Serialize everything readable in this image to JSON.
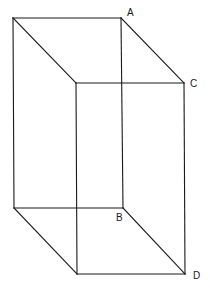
{
  "diagram": {
    "type": "rectangular-prism-wireframe",
    "labels": {
      "A": "A",
      "B": "B",
      "C": "C",
      "D": "D"
    },
    "vertices": {
      "back_top_left": [
        13,
        18
      ],
      "A": [
        121,
        18
      ],
      "back_bottom_left": [
        14,
        208
      ],
      "B": [
        123,
        208
      ],
      "front_top_left": [
        76,
        83
      ],
      "C": [
        184,
        83
      ],
      "front_bottom_left": [
        77,
        274
      ],
      "D": [
        185,
        274
      ]
    },
    "label_positions": {
      "A": [
        127,
        16
      ],
      "B": [
        116,
        221
      ],
      "C": [
        190,
        87
      ],
      "D": [
        193,
        279
      ]
    },
    "colors": {
      "line": "#1a1a1a",
      "background": "#ffffff"
    }
  }
}
